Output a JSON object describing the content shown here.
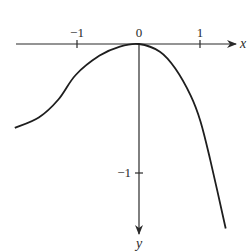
{
  "chart_data": {
    "type": "line",
    "title": "",
    "xlabel": "x",
    "ylabel": "y",
    "y_axis_direction": "down",
    "x_ticks": [
      {
        "value": -1,
        "label": "−1"
      },
      {
        "value": 0,
        "label": "0"
      },
      {
        "value": 1,
        "label": "1"
      }
    ],
    "y_ticks": [
      {
        "value": -1,
        "label": "−1"
      }
    ],
    "xlim": [
      -2.0,
      1.6
    ],
    "ylim": [
      -1.5,
      0.1
    ],
    "grid": false,
    "series": [
      {
        "name": "curve",
        "x": [
          -2.02,
          -1.63,
          -1.31,
          -1.03,
          -0.64,
          -0.31,
          0.0,
          0.34,
          0.59,
          0.84,
          1.0,
          1.16,
          1.41
        ],
        "y": [
          -0.65,
          -0.57,
          -0.43,
          -0.24,
          -0.09,
          -0.02,
          0.0,
          -0.06,
          -0.19,
          -0.4,
          -0.6,
          -0.9,
          -1.43
        ]
      }
    ]
  },
  "labels": {
    "x_axis": "x",
    "y_axis": "y",
    "x_tick_neg1": "−1",
    "x_tick_0": "0",
    "x_tick_1": "1",
    "y_tick_neg1": "−1"
  }
}
